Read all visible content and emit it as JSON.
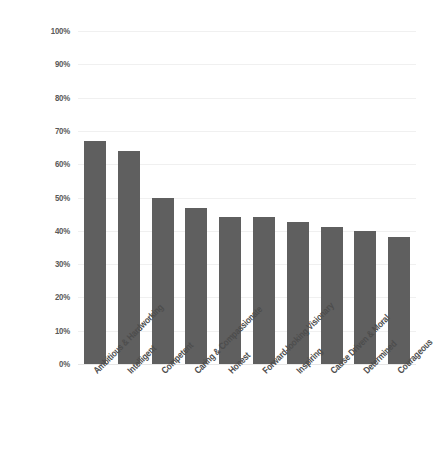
{
  "chart_data": {
    "type": "bar",
    "title": "",
    "xlabel": "",
    "ylabel": "",
    "ylim": [
      0,
      100
    ],
    "grid": true,
    "legend": "none",
    "orientation": "vertical",
    "bar_color": "#5f5f5f",
    "background_color": "#ffffff",
    "gridline_color": "#f0f0f0",
    "categories": [
      "Ambitious & Hardworking",
      "Intelligent",
      "Competent",
      "Caring & Compassionate",
      "Honest",
      "Forward-looking Visionary",
      "Inspiring",
      "Cause Driven & Moral",
      "Determined",
      "Courageous"
    ],
    "values": [
      67,
      64,
      50,
      47,
      44,
      44,
      42.5,
      41,
      40,
      38
    ],
    "ytick_labels": [
      "100%",
      "90%",
      "80%",
      "70%",
      "60%",
      "50%",
      "40%",
      "30%",
      "20%",
      "10%",
      "0%"
    ],
    "ytick_values": [
      100,
      90,
      80,
      70,
      60,
      50,
      40,
      30,
      20,
      10,
      0
    ]
  }
}
